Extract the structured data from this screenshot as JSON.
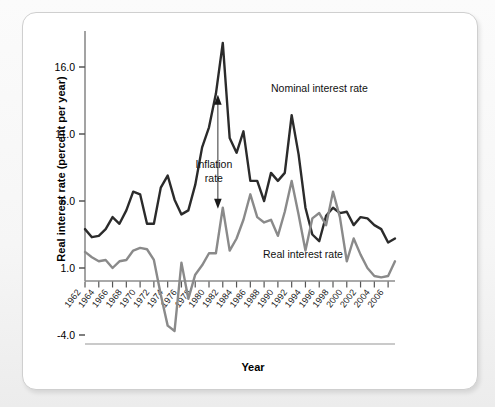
{
  "chart_data": {
    "type": "line",
    "title": "",
    "xlabel": "Year",
    "ylabel": "Real interest rate (percent per year)",
    "ylim": [
      -4.0,
      18.5
    ],
    "yticks": [
      "16.0",
      "11.0",
      "6.0",
      "1.0",
      "-4.0"
    ],
    "ytick_values": [
      16.0,
      11.0,
      6.0,
      1.0,
      -4.0
    ],
    "grid": false,
    "legend_position": "inline-annotations",
    "xlim": [
      1962,
      2007
    ],
    "x": [
      1962,
      1963,
      1964,
      1965,
      1966,
      1967,
      1968,
      1969,
      1970,
      1971,
      1972,
      1973,
      1974,
      1975,
      1976,
      1977,
      1978,
      1979,
      1980,
      1981,
      1982,
      1983,
      1984,
      1985,
      1986,
      1987,
      1988,
      1989,
      1990,
      1991,
      1992,
      1993,
      1994,
      1995,
      1996,
      1997,
      1998,
      1999,
      2000,
      2001,
      2002,
      2003,
      2004,
      2005,
      2006,
      2007
    ],
    "xticks": [
      "1962",
      "1964",
      "1966",
      "1968",
      "1970",
      "1972",
      "1974",
      "1976",
      "1978",
      "1980",
      "1982",
      "1984",
      "1986",
      "1988",
      "1990",
      "1992",
      "1994",
      "1996",
      "1998",
      "2000",
      "2002",
      "2004",
      "2006"
    ],
    "series": [
      {
        "name": "Nominal interest rate",
        "color": "#2b2b2b",
        "values": [
          3.9,
          3.3,
          3.4,
          3.9,
          4.8,
          4.3,
          5.3,
          6.7,
          6.5,
          4.3,
          4.3,
          7.0,
          7.9,
          6.1,
          5.0,
          5.3,
          7.2,
          10.0,
          11.5,
          14.0,
          17.8,
          10.7,
          9.6,
          11.2,
          7.5,
          7.5,
          6.0,
          8.1,
          7.5,
          8.1,
          12.4,
          9.5,
          5.5,
          3.5,
          3.0,
          4.9,
          5.5,
          5.1,
          5.2,
          4.2,
          4.8,
          4.7,
          4.2,
          3.9,
          2.9,
          3.2
        ],
        "values_note": "nominal interest rate, percent per year"
      },
      {
        "name": "Real interest rate",
        "color": "#8a8a8a",
        "values": [
          2.2,
          1.8,
          1.5,
          1.6,
          1.0,
          1.5,
          1.6,
          2.3,
          2.5,
          2.4,
          1.6,
          -1.0,
          -3.3,
          -3.7,
          1.4,
          -1.3,
          0.5,
          1.2,
          2.1,
          2.1,
          5.5,
          2.3,
          3.2,
          4.6,
          6.5,
          4.8,
          4.4,
          4.6,
          3.4,
          5.2,
          7.5,
          5.0,
          2.3,
          4.7,
          5.1,
          4.2,
          6.7,
          4.8,
          1.5,
          3.2,
          2.0,
          1.0,
          0.4,
          0.3,
          0.4,
          1.5
        ],
        "values_note": "real interest rate, percent per year"
      }
    ],
    "annotations": [
      {
        "name": "nominal-label",
        "text": "Nominal interest rate"
      },
      {
        "name": "real-label",
        "text": "Real interest rate"
      },
      {
        "name": "inflation-label",
        "text_line1": "Inflation",
        "text_line2": "rate"
      }
    ]
  },
  "axis": {
    "y_title": "Real interest rate (percent per year)",
    "x_title": "Year"
  }
}
